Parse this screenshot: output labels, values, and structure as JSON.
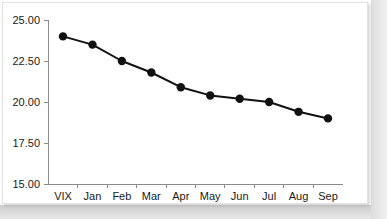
{
  "chart_data": {
    "type": "line",
    "title": "",
    "subtitle": "",
    "xlabel": "",
    "ylabel": "",
    "categories": [
      "VIX",
      "Jan",
      "Feb",
      "Mar",
      "Apr",
      "May",
      "Jun",
      "Jul",
      "Aug",
      "Sep"
    ],
    "values": [
      24.0,
      23.5,
      22.5,
      21.8,
      20.9,
      20.4,
      20.2,
      20.0,
      19.4,
      19.0
    ],
    "series": [
      {
        "name": "VIX futures term structure",
        "values": [
          24.0,
          23.5,
          22.5,
          21.8,
          20.9,
          20.4,
          20.2,
          20.0,
          19.4,
          19.0
        ]
      }
    ],
    "ylim": [
      15.0,
      25.0
    ],
    "ytick_values": [
      25.0,
      22.5,
      20.0,
      17.5,
      15.0
    ],
    "ytick_labels": [
      "25.00",
      "22.50",
      "20.00",
      "17.50",
      "15.00"
    ],
    "xtick_labels": [
      "VIX",
      "Jan",
      "Feb",
      "Mar",
      "Apr",
      "May",
      "Jun",
      "Jul",
      "Aug",
      "Sep"
    ],
    "grid": false,
    "legend": false,
    "legend_position": "none",
    "marker": "filled-circle",
    "line_color": "#111111",
    "marker_color": "#111111",
    "axis_color": "#8a8a8a",
    "background_color": "#ffffff",
    "annotations": []
  }
}
